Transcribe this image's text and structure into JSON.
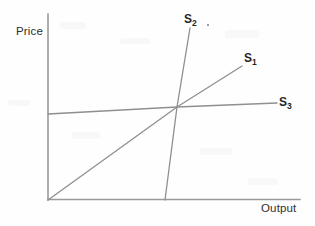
{
  "figure": {
    "background_color": "#fefefe",
    "axis_color": "#9a9a9a",
    "curve_color": "#8f8f8f",
    "text_color": "#262626"
  },
  "axes": {
    "y_label": "Price",
    "x_label": "Output"
  },
  "labels": {
    "s1": {
      "base": "S",
      "sub": "1"
    },
    "s2": {
      "base": "S",
      "sub": "2"
    },
    "s3": {
      "base": "S",
      "sub": "3"
    }
  },
  "chart_data": {
    "type": "line",
    "title": "",
    "xlabel": "Output",
    "ylabel": "Price",
    "grid": false,
    "legend": "inline-curve-labels",
    "axis_origin_px": [
      48,
      200
    ],
    "axis_extent_px": {
      "x_end": 300,
      "y_top": 14
    },
    "common_intersection_px": [
      177,
      107
    ],
    "series": [
      {
        "name": "S1",
        "label": "S₁",
        "elasticity": "moderate",
        "points_px": [
          [
            48,
            200
          ],
          [
            177,
            107
          ],
          [
            242,
            66
          ]
        ]
      },
      {
        "name": "S2",
        "label": "S₂",
        "elasticity": "inelastic (steep / near-vertical)",
        "points_px": [
          [
            165,
            200
          ],
          [
            177,
            107
          ],
          [
            190,
            28
          ]
        ]
      },
      {
        "name": "S3",
        "label": "S₃",
        "elasticity": "elastic (flat / near-horizontal)",
        "points_px": [
          [
            48,
            114
          ],
          [
            177,
            107
          ],
          [
            277,
            103
          ]
        ]
      }
    ]
  }
}
